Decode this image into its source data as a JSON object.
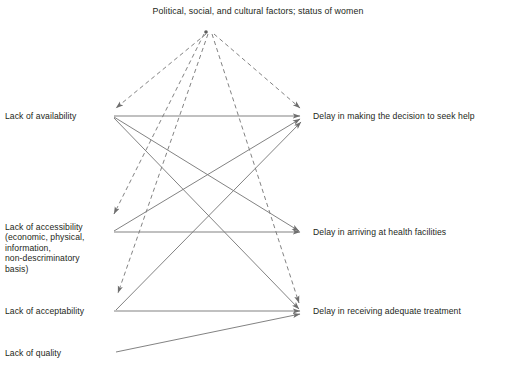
{
  "diagram": {
    "type": "flow-diagram",
    "title": "Political, social, and cultural factors; status of women",
    "background_color": "#ffffff",
    "line_color": "#7b7b7b",
    "text_color": "#231f20",
    "source_node": {
      "id": "context",
      "label": "Political, social, and cultural factors; status of women",
      "x": 206,
      "y": 32
    },
    "left_nodes": [
      {
        "id": "availability",
        "label": "Lack of availability",
        "x": 110,
        "y": 116,
        "label_x": 5,
        "label_y": 111
      },
      {
        "id": "accessibility",
        "label": "Lack of accessibility\n(economic, physical,\ninformation,\nnon-descriminatory\nbasis)",
        "x": 110,
        "y": 232,
        "label_x": 5,
        "label_y": 227
      },
      {
        "id": "acceptability",
        "label": "Lack of acceptability",
        "x": 110,
        "y": 311,
        "label_x": 5,
        "label_y": 306
      },
      {
        "id": "quality",
        "label": "Lack of quality",
        "x": 113,
        "y": 353,
        "label_x": 5,
        "label_y": 348
      }
    ],
    "right_nodes": [
      {
        "id": "delay-decision",
        "label": "Delay in making the decision to seek help",
        "x": 307,
        "y": 116,
        "label_x": 313,
        "label_y": 111
      },
      {
        "id": "delay-arriving",
        "label": "Delay in arriving at health facilities",
        "x": 307,
        "y": 232,
        "label_x": 313,
        "label_y": 227
      },
      {
        "id": "delay-treatment",
        "label": "Delay in receiving adequate treatment",
        "x": 307,
        "y": 311,
        "label_x": 313,
        "label_y": 306
      }
    ],
    "dashed_edges": [
      {
        "from": "context",
        "to": "availability",
        "x1": 206,
        "y1": 34,
        "x2": 116,
        "y2": 108
      },
      {
        "from": "context",
        "to": "accessibility",
        "x1": 204,
        "y1": 34,
        "x2": 114,
        "y2": 214
      },
      {
        "from": "context",
        "to": "acceptability",
        "x1": 208,
        "y1": 34,
        "x2": 118,
        "y2": 293
      },
      {
        "from": "context",
        "to": "delay-decision",
        "x1": 214,
        "y1": 34,
        "x2": 300,
        "y2": 108
      },
      {
        "from": "context",
        "to": "delay-treatment",
        "x1": 212,
        "y1": 34,
        "x2": 299,
        "y2": 303
      }
    ],
    "solid_edges": [
      {
        "from": "availability",
        "to": "delay-decision",
        "x1": 114,
        "y1": 116,
        "x2": 300,
        "y2": 116
      },
      {
        "from": "availability",
        "to": "delay-arriving",
        "x1": 114,
        "y1": 117,
        "x2": 299,
        "y2": 231
      },
      {
        "from": "availability",
        "to": "delay-treatment",
        "x1": 114,
        "y1": 118,
        "x2": 299,
        "y2": 309
      },
      {
        "from": "accessibility",
        "to": "delay-decision",
        "x1": 114,
        "y1": 231,
        "x2": 300,
        "y2": 119
      },
      {
        "from": "accessibility",
        "to": "delay-arriving",
        "x1": 114,
        "y1": 232,
        "x2": 300,
        "y2": 232
      },
      {
        "from": "acceptability",
        "to": "delay-decision",
        "x1": 116,
        "y1": 310,
        "x2": 301,
        "y2": 122
      },
      {
        "from": "acceptability",
        "to": "delay-treatment",
        "x1": 114,
        "y1": 311,
        "x2": 300,
        "y2": 311
      },
      {
        "from": "quality",
        "to": "delay-treatment",
        "x1": 116,
        "y1": 352,
        "x2": 300,
        "y2": 314
      }
    ]
  }
}
